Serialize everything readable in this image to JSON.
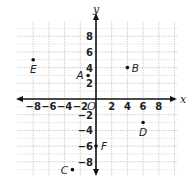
{
  "chart_data": {
    "type": "scatter",
    "title": "",
    "xlabel": "x",
    "ylabel": "y",
    "origin_label": "O",
    "xlim": [
      -10,
      10
    ],
    "ylim": [
      -10,
      10
    ],
    "grid": true,
    "grid_step": 2,
    "x_ticks": [
      -8,
      -6,
      -4,
      -2,
      2,
      4,
      6,
      8
    ],
    "y_ticks": [
      8,
      6,
      4,
      2,
      -2,
      -4,
      -6,
      -8
    ],
    "points": [
      {
        "label": "A",
        "x": -1,
        "y": 3
      },
      {
        "label": "B",
        "x": 4,
        "y": 4
      },
      {
        "label": "C",
        "x": -3,
        "y": -9
      },
      {
        "label": "D",
        "x": 6,
        "y": -3
      },
      {
        "label": "E",
        "x": -8,
        "y": 5
      },
      {
        "label": "F",
        "x": 0,
        "y": -6
      }
    ]
  },
  "layout": {
    "origin_px": [
      96,
      99
    ],
    "unit_px": 7.85,
    "grid_color": "#b8b8b8",
    "axis_color": "#111111"
  }
}
